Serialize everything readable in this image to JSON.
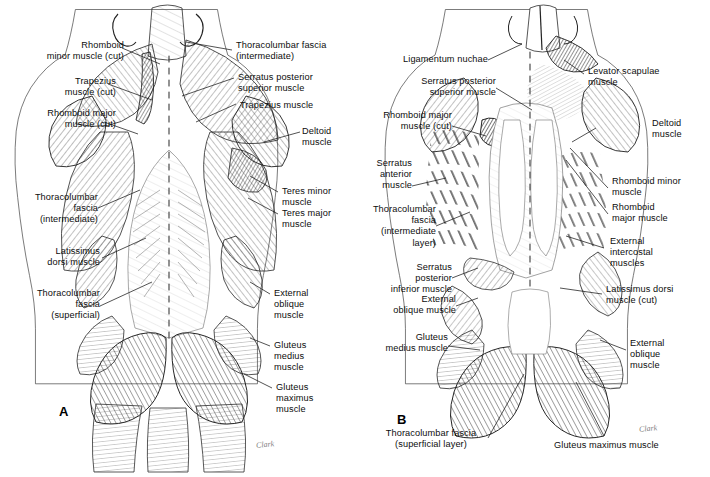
{
  "plate": {
    "panel_a_letter": "A",
    "panel_b_letter": "B",
    "signature": "Clark"
  },
  "panel_a": {
    "labels": [
      {
        "id": "rhomboid-minor-cut",
        "text": "Rhomboid\nminor muscle (cut)"
      },
      {
        "id": "trapezius-cut",
        "text": "Trapezius\nmuscle (cut)"
      },
      {
        "id": "rhomboid-major-cut",
        "text": "Rhomboid major\nmuscle (cut)"
      },
      {
        "id": "thoracolumbar-intermediate",
        "text": "Thoracolumbar\nfascia\n(intermediate)"
      },
      {
        "id": "latissimus-dorsi",
        "text": "Latissimus\ndorsi muscle"
      },
      {
        "id": "thoracolumbar-superficial",
        "text": "Thoracolumbar\nfascia\n(superficial)"
      },
      {
        "id": "thoracolumbar-fascia-top",
        "text": "Thoracolumbar fascia\n(intermediate)"
      },
      {
        "id": "serratus-posterior-superior",
        "text": "Serratus posterior\nsuperior muscle"
      },
      {
        "id": "trapezius",
        "text": "Trapezius muscle"
      },
      {
        "id": "deltoid",
        "text": "Deltoid\nmuscle"
      },
      {
        "id": "teres-minor",
        "text": "Teres minor\nmuscle"
      },
      {
        "id": "teres-major",
        "text": "Teres major\nmuscle"
      },
      {
        "id": "external-oblique",
        "text": "External\noblique\nmuscle"
      },
      {
        "id": "gluteus-medius",
        "text": "Gluteus\nmedius\nmuscle"
      },
      {
        "id": "gluteus-maximus",
        "text": "Gluteus\nmaximus\nmuscle"
      }
    ]
  },
  "panel_b": {
    "labels": [
      {
        "id": "ligamentum-nuchae",
        "text": "Ligamentum nuchae"
      },
      {
        "id": "serratus-posterior-superior",
        "text": "Serratus posterior\nsuperior muscle"
      },
      {
        "id": "rhomboid-major-cut",
        "text": "Rhomboid major\nmuscle (cut)"
      },
      {
        "id": "serratus-anterior",
        "text": "Serratus\nanterior\nmuscle"
      },
      {
        "id": "thoracolumbar-intermediate",
        "text": "Thoracolumbar\nfascia\n(intermediate\nlayer)"
      },
      {
        "id": "serratus-posterior-inferior",
        "text": "Serratus\nposterior\ninferior muscle"
      },
      {
        "id": "external-oblique-left",
        "text": "External\noblique muscle"
      },
      {
        "id": "gluteus-medius",
        "text": "Gluteus\nmedius muscle"
      },
      {
        "id": "thoracolumbar-superficial",
        "text": "Thoracolumbar fascia\n(superficial layer)"
      },
      {
        "id": "gluteus-maximus",
        "text": "Gluteus maximus muscle"
      },
      {
        "id": "levator-scapulae",
        "text": "Levator scapulae\nmuscle"
      },
      {
        "id": "deltoid",
        "text": "Deltoid\nmuscle"
      },
      {
        "id": "rhomboid-minor",
        "text": "Rhomboid minor\nmuscle"
      },
      {
        "id": "rhomboid-major",
        "text": "Rhomboid\nmajor muscle"
      },
      {
        "id": "external-intercostal",
        "text": "External\nintercostal\nmuscles"
      },
      {
        "id": "latissimus-dorsi-cut",
        "text": "Latissimus dorsi\nmuscle (cut)"
      },
      {
        "id": "external-oblique-right",
        "text": "External\noblique\nmuscle"
      }
    ]
  }
}
